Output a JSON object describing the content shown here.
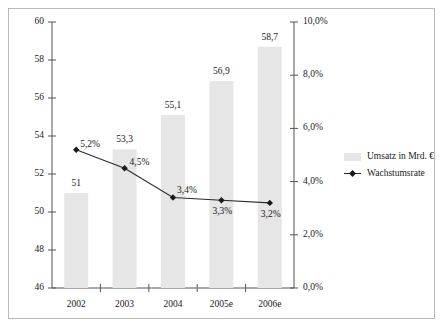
{
  "chart_data": {
    "type": "bar",
    "title": "",
    "subtitle": "",
    "xlabel": "",
    "ylabel": "",
    "y2label": "",
    "grid": false,
    "legend_position": "right",
    "categories": [
      "2002",
      "2003",
      "2004",
      "2005e",
      "2006e"
    ],
    "ylim": [
      46,
      60
    ],
    "yticks": [
      "46",
      "48",
      "50",
      "52",
      "54",
      "56",
      "58",
      "60"
    ],
    "ytick_values": [
      46,
      48,
      50,
      52,
      54,
      56,
      58,
      60
    ],
    "y2lim": [
      0,
      10
    ],
    "y2ticks": [
      "0,0%",
      "2,0%",
      "4,0%",
      "6,0%",
      "8,0%",
      "10,0%"
    ],
    "y2tick_values": [
      0,
      2,
      4,
      6,
      8,
      10
    ],
    "series": [
      {
        "name": "Umsatz in Mrd. €",
        "type": "bar",
        "axis": "left",
        "values": [
          51,
          53.3,
          55.1,
          56.9,
          58.7
        ],
        "labels": [
          "51",
          "53,3",
          "55,1",
          "56,9",
          "58,7"
        ],
        "color": "#e6e6e6"
      },
      {
        "name": "Wachstumsrate",
        "type": "line",
        "axis": "right",
        "values": [
          5.2,
          4.5,
          3.4,
          3.3,
          3.2
        ],
        "labels": [
          "5,2%",
          "4,5%",
          "3,4%",
          "3,3%",
          "3,2%"
        ],
        "color": "#2b2b2b",
        "marker": "diamond"
      }
    ]
  },
  "legend": {
    "items": [
      {
        "label": "Umsatz in Mrd. €",
        "swatch": "bar-swatch"
      },
      {
        "label": "Wachstumsrate",
        "swatch": "line-marker-swatch"
      }
    ]
  },
  "colors": {
    "bar_fill": "#e6e6e6",
    "line": "#2b2b2b",
    "marker": "#1a1a1a",
    "axis": "#555555",
    "frame_border": "#b9b9b9",
    "text": "#1a1a1a",
    "background": "#ffffff"
  }
}
